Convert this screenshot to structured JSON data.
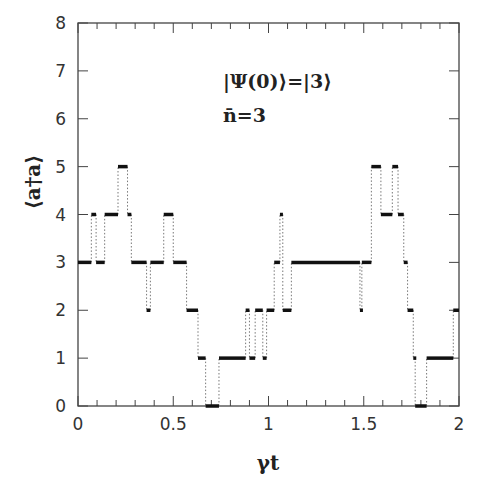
{
  "chart_data": {
    "type": "line",
    "subtype": "step",
    "title": "",
    "xlabel": "γt",
    "ylabel": "⟨a†a⟩",
    "xlim": [
      0,
      2
    ],
    "ylim": [
      0,
      8
    ],
    "xticks": [
      "0",
      "0.5",
      "1",
      "1.5",
      "2"
    ],
    "yticks": [
      "0",
      "1",
      "2",
      "3",
      "4",
      "5",
      "6",
      "7",
      "8"
    ],
    "x_minor_tick_step": 0.1,
    "grid": false,
    "legend": null,
    "annotations": [
      "|Ψ(0)⟩=|3⟩",
      "n̄=3"
    ],
    "series": [
      {
        "name": "⟨a†a⟩ quantum trajectory",
        "style": "thick horizontal segments joined by dotted vertical jumps",
        "segments": [
          {
            "t0": 0.0,
            "t1": 0.07,
            "n": 3
          },
          {
            "t0": 0.07,
            "t1": 0.095,
            "n": 4
          },
          {
            "t0": 0.095,
            "t1": 0.14,
            "n": 3
          },
          {
            "t0": 0.14,
            "t1": 0.21,
            "n": 4
          },
          {
            "t0": 0.21,
            "t1": 0.26,
            "n": 5
          },
          {
            "t0": 0.26,
            "t1": 0.28,
            "n": 4
          },
          {
            "t0": 0.28,
            "t1": 0.36,
            "n": 3
          },
          {
            "t0": 0.36,
            "t1": 0.38,
            "n": 2
          },
          {
            "t0": 0.38,
            "t1": 0.45,
            "n": 3
          },
          {
            "t0": 0.45,
            "t1": 0.5,
            "n": 4
          },
          {
            "t0": 0.5,
            "t1": 0.57,
            "n": 3
          },
          {
            "t0": 0.57,
            "t1": 0.63,
            "n": 2
          },
          {
            "t0": 0.63,
            "t1": 0.67,
            "n": 1
          },
          {
            "t0": 0.67,
            "t1": 0.74,
            "n": 0
          },
          {
            "t0": 0.74,
            "t1": 0.88,
            "n": 1
          },
          {
            "t0": 0.88,
            "t1": 0.9,
            "n": 2
          },
          {
            "t0": 0.9,
            "t1": 0.93,
            "n": 1
          },
          {
            "t0": 0.93,
            "t1": 0.97,
            "n": 2
          },
          {
            "t0": 0.97,
            "t1": 0.99,
            "n": 1
          },
          {
            "t0": 0.99,
            "t1": 1.03,
            "n": 2
          },
          {
            "t0": 1.03,
            "t1": 1.06,
            "n": 3
          },
          {
            "t0": 1.06,
            "t1": 1.075,
            "n": 4
          },
          {
            "t0": 1.075,
            "t1": 1.12,
            "n": 2
          },
          {
            "t0": 1.12,
            "t1": 1.48,
            "n": 3
          },
          {
            "t0": 1.48,
            "t1": 1.49,
            "n": 2
          },
          {
            "t0": 1.49,
            "t1": 1.54,
            "n": 3
          },
          {
            "t0": 1.54,
            "t1": 1.59,
            "n": 5
          },
          {
            "t0": 1.59,
            "t1": 1.65,
            "n": 4
          },
          {
            "t0": 1.65,
            "t1": 1.68,
            "n": 5
          },
          {
            "t0": 1.68,
            "t1": 1.71,
            "n": 4
          },
          {
            "t0": 1.71,
            "t1": 1.73,
            "n": 3
          },
          {
            "t0": 1.73,
            "t1": 1.76,
            "n": 2
          },
          {
            "t0": 1.76,
            "t1": 1.77,
            "n": 1
          },
          {
            "t0": 1.77,
            "t1": 1.83,
            "n": 0
          },
          {
            "t0": 1.83,
            "t1": 1.97,
            "n": 1
          },
          {
            "t0": 1.97,
            "t1": 2.0,
            "n": 2
          }
        ]
      }
    ]
  },
  "colors": {
    "axis": "#444444",
    "data": "#111111",
    "jump": "#777777",
    "background": "#ffffff"
  }
}
